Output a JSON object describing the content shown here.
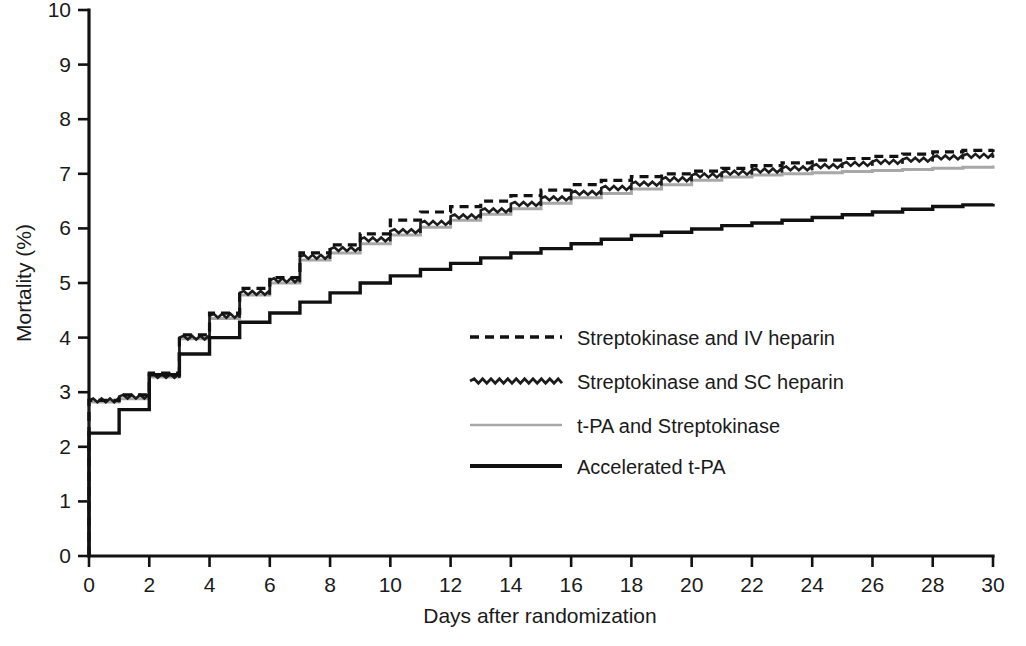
{
  "chart_data": {
    "type": "line",
    "subtype": "kaplan-meier-step",
    "title": "",
    "xlabel": "Days after randomization",
    "ylabel": "Mortality (%)",
    "xlim": [
      0,
      30
    ],
    "ylim": [
      0,
      10
    ],
    "xticks": [
      0,
      2,
      4,
      6,
      8,
      10,
      12,
      14,
      16,
      18,
      20,
      22,
      24,
      26,
      28,
      30
    ],
    "yticks": [
      0,
      1,
      2,
      3,
      4,
      5,
      6,
      7,
      8,
      9,
      10
    ],
    "xtick_labels": [
      "0",
      "2",
      "4",
      "6",
      "8",
      "10",
      "12",
      "14",
      "16",
      "18",
      "20",
      "22",
      "24",
      "26",
      "28",
      "30"
    ],
    "ytick_labels": [
      "0",
      "1",
      "2",
      "3",
      "4",
      "5",
      "6",
      "7",
      "8",
      "9",
      "10"
    ],
    "grid": false,
    "legend_position": "center-right-inside",
    "x": [
      0,
      1,
      2,
      3,
      4,
      5,
      6,
      7,
      8,
      9,
      10,
      11,
      12,
      13,
      14,
      15,
      16,
      17,
      18,
      19,
      20,
      21,
      22,
      23,
      24,
      25,
      26,
      27,
      28,
      29,
      30
    ],
    "series": [
      {
        "name": "Streptokinase and IV heparin",
        "style": "dashed",
        "color": "#111111",
        "values": [
          2.85,
          2.95,
          3.35,
          4.05,
          4.45,
          4.9,
          5.1,
          5.55,
          5.7,
          5.9,
          6.15,
          6.3,
          6.4,
          6.5,
          6.6,
          6.7,
          6.8,
          6.88,
          6.95,
          7.0,
          7.05,
          7.1,
          7.15,
          7.2,
          7.25,
          7.28,
          7.32,
          7.36,
          7.4,
          7.43,
          7.45
        ]
      },
      {
        "name": "Streptokinase and SC heparin",
        "style": "wavy",
        "color": "#1c1c1c",
        "values": [
          2.85,
          2.92,
          3.3,
          4.0,
          4.4,
          4.82,
          5.05,
          5.48,
          5.62,
          5.8,
          5.95,
          6.1,
          6.22,
          6.33,
          6.45,
          6.55,
          6.65,
          6.74,
          6.82,
          6.9,
          6.97,
          7.02,
          7.06,
          7.1,
          7.14,
          7.18,
          7.22,
          7.26,
          7.3,
          7.33,
          7.35
        ]
      },
      {
        "name": "t-PA and Streptokinase",
        "style": "solid-light",
        "color": "#a8a8a8",
        "values": [
          2.82,
          2.88,
          3.28,
          3.98,
          4.35,
          4.78,
          5.0,
          5.42,
          5.55,
          5.72,
          5.88,
          6.02,
          6.15,
          6.26,
          6.36,
          6.46,
          6.56,
          6.64,
          6.72,
          6.8,
          6.88,
          6.94,
          6.98,
          7.0,
          7.02,
          7.04,
          7.06,
          7.08,
          7.1,
          7.12,
          7.15
        ]
      },
      {
        "name": "Accelerated t-PA",
        "style": "solid-bold",
        "color": "#111111",
        "values": [
          2.25,
          2.68,
          3.32,
          3.7,
          4.0,
          4.28,
          4.45,
          4.65,
          4.82,
          5.0,
          5.13,
          5.25,
          5.36,
          5.46,
          5.55,
          5.63,
          5.72,
          5.8,
          5.87,
          5.93,
          5.99,
          6.05,
          6.1,
          6.15,
          6.2,
          6.25,
          6.3,
          6.35,
          6.4,
          6.43,
          6.45
        ]
      }
    ]
  },
  "legend": {
    "items": [
      {
        "label": "Streptokinase and IV heparin",
        "swatch": "dashed"
      },
      {
        "label": "Streptokinase and SC heparin",
        "swatch": "wavy"
      },
      {
        "label": "t-PA and Streptokinase",
        "swatch": "solid-light"
      },
      {
        "label": "Accelerated t-PA",
        "swatch": "solid-bold"
      }
    ]
  },
  "colors": {
    "axis": "#121212",
    "series_dark": "#111111",
    "series_gray": "#a8a8a8",
    "background": "#ffffff"
  }
}
